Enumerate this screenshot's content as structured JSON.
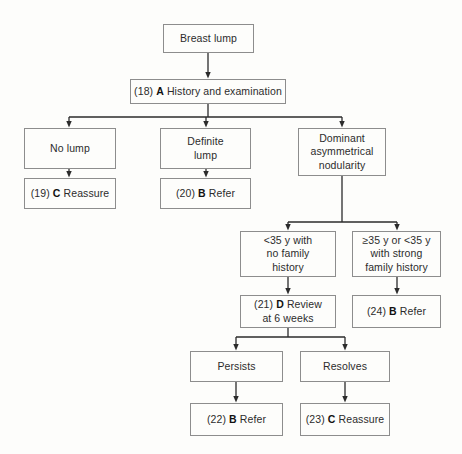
{
  "diagram": {
    "background_color": "#fdfdfb",
    "box_border_color": "#8d8d8d",
    "connector_color": "#2b2b2b",
    "nodes": [
      {
        "id": "breast-lump",
        "label": "Breast lump",
        "ref": "",
        "grade": "",
        "x": 163,
        "y": 24,
        "w": 91,
        "h": 29
      },
      {
        "id": "history-and-examination",
        "label": "History and examination",
        "ref": "(18)",
        "grade": "A",
        "x": 130,
        "y": 79,
        "w": 156,
        "h": 25
      },
      {
        "id": "no-lump",
        "label": "No lump",
        "ref": "",
        "grade": "",
        "x": 24,
        "y": 128,
        "w": 92,
        "h": 41
      },
      {
        "id": "definite-lump",
        "label": "Definite\nlump",
        "ref": "",
        "grade": "",
        "x": 160,
        "y": 128,
        "w": 91,
        "h": 41
      },
      {
        "id": "dominant-asymmetrical-nodularity",
        "label": "Dominant\nasymmetrical\nnodularity",
        "ref": "",
        "grade": "",
        "x": 298,
        "y": 128,
        "w": 88,
        "h": 48
      },
      {
        "id": "reassure-19",
        "label": "Reassure",
        "ref": "(19)",
        "grade": "C",
        "x": 24,
        "y": 178,
        "w": 92,
        "h": 31
      },
      {
        "id": "refer-20",
        "label": "Refer",
        "ref": "(20)",
        "grade": "B",
        "x": 160,
        "y": 178,
        "w": 91,
        "h": 31
      },
      {
        "id": "under-35-no-family-history",
        "label": "<35 y with\nno family\nhistory",
        "ref": "",
        "grade": "",
        "x": 240,
        "y": 231,
        "w": 96,
        "h": 46
      },
      {
        "id": "over-35-or-strong-family-history",
        "label": "≥35 y or <35 y\nwith strong\nfamily history",
        "ref": "",
        "grade": "",
        "x": 352,
        "y": 231,
        "w": 89,
        "h": 46
      },
      {
        "id": "review-at-6-weeks-21",
        "label": "Review\nat 6 weeks",
        "ref": "(21)",
        "grade": "D",
        "x": 240,
        "y": 295,
        "w": 96,
        "h": 33
      },
      {
        "id": "refer-24",
        "label": "Refer",
        "ref": "(24)",
        "grade": "B",
        "x": 352,
        "y": 295,
        "w": 89,
        "h": 33
      },
      {
        "id": "persists",
        "label": "Persists",
        "ref": "",
        "grade": "",
        "x": 190,
        "y": 351,
        "w": 93,
        "h": 31
      },
      {
        "id": "resolves",
        "label": "Resolves",
        "ref": "",
        "grade": "",
        "x": 300,
        "y": 351,
        "w": 90,
        "h": 31
      },
      {
        "id": "refer-22",
        "label": "Refer",
        "ref": "(22)",
        "grade": "B",
        "x": 190,
        "y": 403,
        "w": 93,
        "h": 33
      },
      {
        "id": "reassure-23",
        "label": "Reassure",
        "ref": "(23)",
        "grade": "C",
        "x": 300,
        "y": 403,
        "w": 90,
        "h": 33
      }
    ],
    "edges": [
      {
        "from": "breast-lump",
        "to": "history-and-examination",
        "kind": "straight"
      },
      {
        "from": "history-and-examination",
        "to": "no-lump",
        "kind": "branch"
      },
      {
        "from": "history-and-examination",
        "to": "definite-lump",
        "kind": "branch"
      },
      {
        "from": "history-and-examination",
        "to": "dominant-asymmetrical-nodularity",
        "kind": "branch"
      },
      {
        "from": "no-lump",
        "to": "reassure-19",
        "kind": "straight"
      },
      {
        "from": "definite-lump",
        "to": "refer-20",
        "kind": "straight"
      },
      {
        "from": "dominant-asymmetrical-nodularity",
        "to": "under-35-no-family-history",
        "kind": "branch"
      },
      {
        "from": "dominant-asymmetrical-nodularity",
        "to": "over-35-or-strong-family-history",
        "kind": "branch"
      },
      {
        "from": "under-35-no-family-history",
        "to": "review-at-6-weeks-21",
        "kind": "straight"
      },
      {
        "from": "over-35-or-strong-family-history",
        "to": "refer-24",
        "kind": "straight"
      },
      {
        "from": "review-at-6-weeks-21",
        "to": "persists",
        "kind": "branch"
      },
      {
        "from": "review-at-6-weeks-21",
        "to": "resolves",
        "kind": "branch"
      },
      {
        "from": "persists",
        "to": "refer-22",
        "kind": "straight"
      },
      {
        "from": "resolves",
        "to": "reassure-23",
        "kind": "straight"
      }
    ]
  }
}
